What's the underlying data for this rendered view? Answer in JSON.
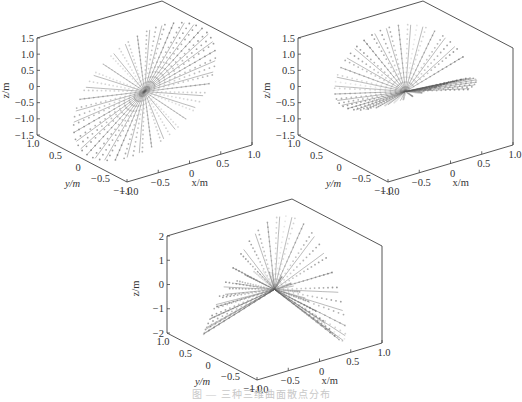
{
  "figure": {
    "caption": "图 — 三种三维曲面散点分布"
  },
  "chart_data": [
    {
      "type": "scatter3d",
      "title": "",
      "shape": "tilted elliptical disk with radial spokes",
      "xlabel": "x/m",
      "ylabel": "y/m",
      "zlabel": "z/m",
      "xlim": [
        -1.0,
        1.0
      ],
      "ylim": [
        -1.0,
        1.0
      ],
      "zlim": [
        -1.5,
        1.5
      ],
      "xticks": [
        "-1.0",
        "-0.5",
        "0",
        "0.5",
        "1.0"
      ],
      "yticks": [
        "1.0",
        "0.5",
        "0",
        "-0.5",
        "-1.0"
      ],
      "zticks": [
        "1.5",
        "1.0",
        "0.5",
        "0",
        "-0.5",
        "-1.0",
        "-1.5"
      ],
      "grid": false,
      "legend": null
    },
    {
      "type": "scatter3d",
      "title": "",
      "shape": "twisted saddle surface (one half-wave)",
      "xlabel": "x/m",
      "ylabel": "y/m",
      "zlabel": "z/m",
      "xlim": [
        -1.0,
        1.0
      ],
      "ylim": [
        -1.0,
        1.0
      ],
      "zlim": [
        -1.5,
        1.5
      ],
      "xticks": [
        "-1.0",
        "-0.5",
        "0",
        "0.5",
        "1.0"
      ],
      "yticks": [
        "1.0",
        "0.5",
        "0",
        "-0.5",
        "-1.0"
      ],
      "zticks": [
        "1.5",
        "1.0",
        "0.5",
        "0",
        "-0.5",
        "-1.0",
        "-1.5"
      ],
      "grid": false,
      "legend": null
    },
    {
      "type": "scatter3d",
      "title": "",
      "shape": "wavy surface with two opposite peaks (full wave)",
      "xlabel": "x/m",
      "ylabel": "y/m",
      "zlabel": "z/m",
      "xlim": [
        -1.0,
        1.0
      ],
      "ylim": [
        -1.0,
        1.0
      ],
      "zlim": [
        -2,
        2
      ],
      "xticks": [
        "-1.0",
        "-0.5",
        "0",
        "0.5",
        "1.0"
      ],
      "yticks": [
        "1.0",
        "0.5",
        "0",
        "-0.5",
        "-1.0"
      ],
      "zticks": [
        "2",
        "1",
        "0",
        "-1",
        "-2"
      ],
      "grid": false,
      "legend": null
    }
  ]
}
